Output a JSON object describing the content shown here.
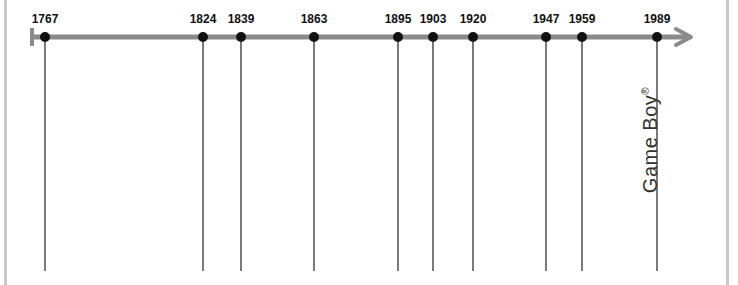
{
  "timeline": {
    "axis_color": "#8a8a8a",
    "marker_color": "#111111",
    "events": [
      {
        "year": "1767",
        "x": 45
      },
      {
        "year": "1824",
        "x": 203
      },
      {
        "year": "1839",
        "x": 241
      },
      {
        "year": "1863",
        "x": 314
      },
      {
        "year": "1895",
        "x": 398
      },
      {
        "year": "1903",
        "x": 433
      },
      {
        "year": "1920",
        "x": 473
      },
      {
        "year": "1947",
        "x": 546
      },
      {
        "year": "1959",
        "x": 582
      },
      {
        "year": "1989",
        "x": 657
      }
    ],
    "annotation": {
      "text": "Game Boy",
      "superscript": "®",
      "year": "1989"
    }
  }
}
